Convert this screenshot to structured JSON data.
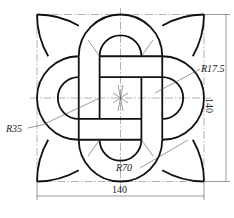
{
  "drawing": {
    "type": "interlaced-knot-technical-drawing",
    "dimensions": {
      "width_label": "140",
      "height_label": "140",
      "radius_small_label": "R17.5",
      "radius_loop_label": "R35",
      "radius_petal_label": "R70"
    },
    "units": {
      "square_size": 140,
      "loop_outer_radius": 35,
      "loop_inner_radius": 17.5,
      "petal_radius": 70
    },
    "colors": {
      "outline": "#111111",
      "thin_line": "#555555",
      "background": "#ffffff"
    }
  }
}
